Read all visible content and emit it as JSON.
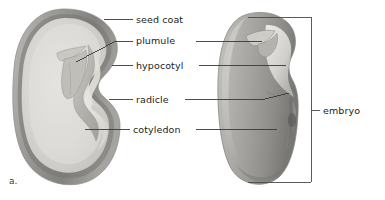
{
  "figure": {
    "panel_letter": "a.",
    "caption_alt": "Bean seed structure: external view and longitudinal section",
    "background_color": "#ffffff",
    "line_color": "#3a3a3a",
    "text_color": "#1c1c1c"
  },
  "labels": {
    "seed_coat": "seed coat",
    "plumule": "plumule",
    "hypocotyl": "hypocotyl",
    "radicle": "radicle",
    "cotyledon": "cotyledon",
    "embryo": "embryo"
  },
  "specimens": {
    "left": {
      "name": "bean seed longitudinal section",
      "seed_coat_color": "#9d9d9d",
      "cotyledon_color": "#d6d5d2",
      "embryo_color": "#b9b8b3"
    },
    "right": {
      "name": "bean seed whole external view",
      "body_color": "#a9a8a4",
      "highlight_color": "#e2e1dd"
    }
  },
  "annotations": {
    "bracket": {
      "name": "embryo-bracket",
      "spans": "whole right seed",
      "color": "#4a4a4a"
    }
  }
}
